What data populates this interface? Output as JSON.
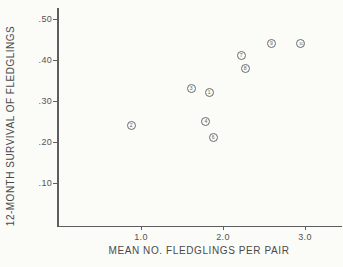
{
  "figure": {
    "paper_color": "#fbfbf8",
    "ink_color": "#4c4c4c"
  },
  "chart_data": {
    "type": "scatter",
    "title": "",
    "xlabel": "MEAN NO. FLEDGLINGS PER PAIR",
    "ylabel": "12-MONTH SURVIVAL OF FLEDGLINGS",
    "xlim": [
      0.0,
      3.45
    ],
    "ylim": [
      0.0,
      0.55
    ],
    "grid": false,
    "legend": "none",
    "marker_style": "circled-number",
    "x_ticks": [
      {
        "value": 1.0,
        "label": "1.0"
      },
      {
        "value": 2.0,
        "label": "2.0"
      },
      {
        "value": 3.0,
        "label": "3.0"
      }
    ],
    "y_ticks": [
      {
        "value": 0.5,
        "label": ".50"
      },
      {
        "value": 0.4,
        "label": ".40"
      },
      {
        "value": 0.3,
        "label": ".30"
      },
      {
        "value": 0.2,
        "label": ".20"
      },
      {
        "value": 0.1,
        "label": ".10"
      }
    ],
    "points": [
      {
        "label": "1",
        "x": 1.83,
        "y": 0.32
      },
      {
        "label": "2",
        "x": 0.88,
        "y": 0.24
      },
      {
        "label": "3",
        "x": 1.61,
        "y": 0.33
      },
      {
        "label": "4",
        "x": 1.79,
        "y": 0.25
      },
      {
        "label": "6",
        "x": 1.88,
        "y": 0.21
      },
      {
        "label": "7",
        "x": 2.22,
        "y": 0.41
      },
      {
        "label": "8",
        "x": 2.27,
        "y": 0.38
      },
      {
        "label": "9",
        "x": 2.59,
        "y": 0.44
      },
      {
        "label": "10",
        "x": 2.95,
        "y": 0.44
      }
    ]
  }
}
